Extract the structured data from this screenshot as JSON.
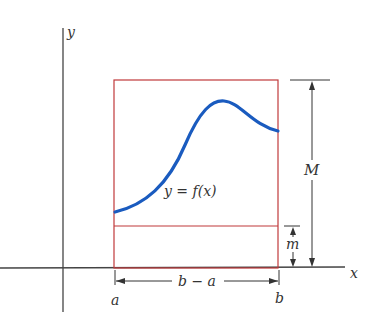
{
  "diagram": {
    "labels": {
      "y_axis": "y",
      "x_axis": "x",
      "curve": "y = f(x)",
      "max": "M",
      "min": "m",
      "a": "a",
      "b": "b",
      "width": "b − a"
    },
    "colors": {
      "axis": "#444444",
      "rectangle": "#c0393b",
      "curve": "#1a5bbf",
      "dimension": "#333333"
    }
  }
}
